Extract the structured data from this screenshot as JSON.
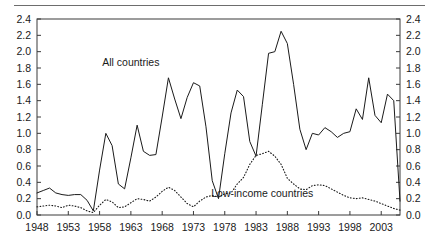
{
  "figure": {
    "background_color": "#ffffff",
    "top_rule_color": "#6d6d6d",
    "axis_color": "#3a3a3a",
    "series_color": "#1a1a1a"
  },
  "chart_data": {
    "type": "line",
    "title": "",
    "subtitle": "",
    "xlabel": "",
    "ylabel": "",
    "xlim": [
      1948,
      2006
    ],
    "ylim": [
      0.0,
      2.4
    ],
    "grid": false,
    "legend_position": "inline-annotation",
    "y_axis_left": {
      "ticks": [
        "0.0",
        "0.2",
        "0.4",
        "0.6",
        "0.8",
        "1.0",
        "1.2",
        "1.4",
        "1.6",
        "1.8",
        "2.0",
        "2.2",
        "2.4"
      ],
      "min": 0.0,
      "max": 2.4,
      "step": 0.2
    },
    "y_axis_right": {
      "ticks": [
        "0.0",
        "0.2",
        "0.4",
        "0.6",
        "0.8",
        "1.0",
        "1.2",
        "1.4",
        "1.6",
        "1.8",
        "2.0",
        "2.2",
        "2.4"
      ],
      "min": 0.0,
      "max": 2.4,
      "step": 0.2
    },
    "x_axis": {
      "tick_labels": [
        "1948",
        "1953",
        "1958",
        "1963",
        "1968",
        "1973",
        "1978",
        "1983",
        "1988",
        "1993",
        "1998",
        "2003"
      ],
      "tick_values": [
        1948,
        1953,
        1958,
        1963,
        1968,
        1973,
        1978,
        1983,
        1988,
        1993,
        1998,
        2003
      ],
      "min": 1948,
      "max": 2006,
      "step": 5
    },
    "annotations": [
      {
        "text": "All countries",
        "x": 1963,
        "y": 1.82
      },
      {
        "text": "Low-income countries",
        "x": 1984,
        "y": 0.22
      }
    ],
    "x": [
      1948,
      1949,
      1950,
      1951,
      1952,
      1953,
      1954,
      1955,
      1956,
      1957,
      1958,
      1959,
      1960,
      1961,
      1962,
      1963,
      1964,
      1965,
      1966,
      1967,
      1968,
      1969,
      1970,
      1971,
      1972,
      1973,
      1974,
      1975,
      1976,
      1977,
      1978,
      1979,
      1980,
      1981,
      1982,
      1983,
      1984,
      1985,
      1986,
      1987,
      1988,
      1989,
      1990,
      1991,
      1992,
      1993,
      1994,
      1995,
      1996,
      1997,
      1998,
      1999,
      2000,
      2001,
      2002,
      2003,
      2004,
      2005,
      2006
    ],
    "series": [
      {
        "name": "All countries",
        "style": "solid",
        "values": [
          0.27,
          0.3,
          0.33,
          0.27,
          0.25,
          0.24,
          0.25,
          0.25,
          0.18,
          0.05,
          0.55,
          1.0,
          0.85,
          0.38,
          0.32,
          0.7,
          1.1,
          0.78,
          0.73,
          0.74,
          1.2,
          1.68,
          1.42,
          1.18,
          1.44,
          1.62,
          1.58,
          1.08,
          0.42,
          0.2,
          0.75,
          1.25,
          1.53,
          1.45,
          0.9,
          0.72,
          1.35,
          1.98,
          2.0,
          2.25,
          2.1,
          1.6,
          1.05,
          0.8,
          1.0,
          0.98,
          1.07,
          1.02,
          0.95,
          1.0,
          1.02,
          1.3,
          1.17,
          1.68,
          1.22,
          1.13,
          1.48,
          1.4,
          0.17
        ]
      },
      {
        "name": "Low-income countries",
        "style": "dotted",
        "values": [
          0.1,
          0.11,
          0.12,
          0.11,
          0.09,
          0.12,
          0.11,
          0.09,
          0.05,
          0.03,
          0.12,
          0.19,
          0.16,
          0.09,
          0.1,
          0.15,
          0.2,
          0.19,
          0.17,
          0.22,
          0.29,
          0.34,
          0.3,
          0.22,
          0.14,
          0.1,
          0.17,
          0.22,
          0.24,
          0.22,
          0.26,
          0.27,
          0.38,
          0.46,
          0.62,
          0.73,
          0.75,
          0.78,
          0.72,
          0.62,
          0.45,
          0.38,
          0.32,
          0.31,
          0.36,
          0.37,
          0.36,
          0.32,
          0.28,
          0.24,
          0.21,
          0.2,
          0.21,
          0.19,
          0.17,
          0.14,
          0.11,
          0.08,
          0.06
        ]
      }
    ]
  }
}
